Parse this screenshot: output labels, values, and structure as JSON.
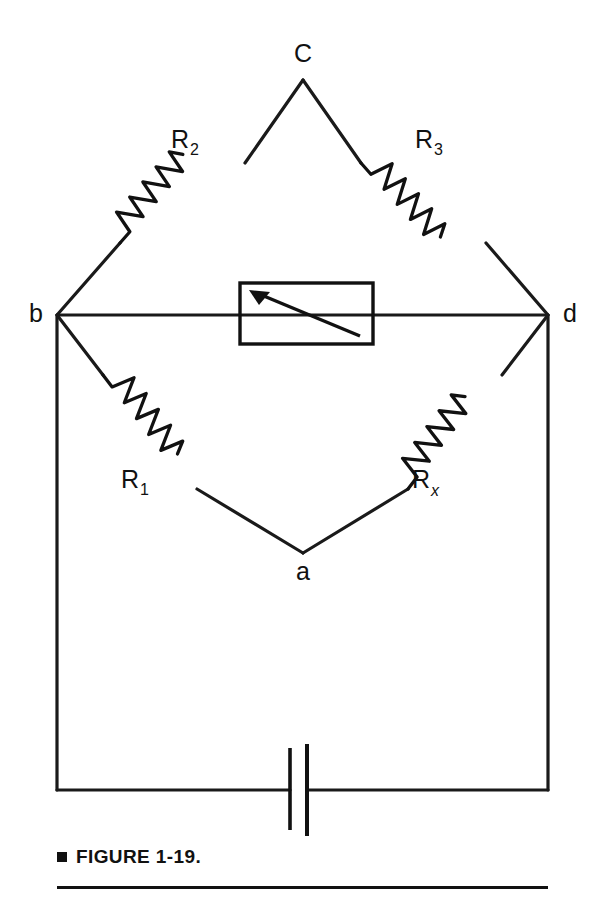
{
  "figure": {
    "caption_bullet": "■",
    "caption_text": "FIGURE 1-19."
  },
  "nodes": [
    {
      "id": "c",
      "label": "C",
      "x": 303,
      "y": 80,
      "label_x": 303,
      "label_y": 62
    },
    {
      "id": "b",
      "label": "b",
      "x": 57,
      "y": 315,
      "label_x": 36,
      "label_y": 322
    },
    {
      "id": "d",
      "label": "d",
      "x": 548,
      "y": 315,
      "label_x": 570,
      "label_y": 322
    },
    {
      "id": "a",
      "label": "a",
      "x": 303,
      "y": 553,
      "label_x": 303,
      "label_y": 580
    }
  ],
  "resistors": [
    {
      "id": "r2",
      "base": "R",
      "sub": "2",
      "sub_italic": false,
      "label_x": 180,
      "label_y": 148,
      "branch": "b-c"
    },
    {
      "id": "r3",
      "base": "R",
      "sub": "3",
      "sub_italic": false,
      "label_x": 424,
      "label_y": 148,
      "branch": "c-d"
    },
    {
      "id": "r1",
      "base": "R",
      "sub": "1",
      "sub_italic": false,
      "label_x": 130,
      "label_y": 488,
      "branch": "b-a"
    },
    {
      "id": "rx",
      "base": "R",
      "sub": "x",
      "sub_italic": true,
      "label_x": 421,
      "label_y": 488,
      "branch": "a-d"
    }
  ],
  "meter": {
    "name": "galvanometer",
    "box": {
      "x": 240,
      "y": 283,
      "width": 133,
      "height": 61
    },
    "needle_from": {
      "x": 360,
      "y": 336
    },
    "needle_to": {
      "x": 252,
      "y": 291
    }
  },
  "battery": {
    "name": "battery",
    "wire_y": 790,
    "negative_plate": {
      "x": 290,
      "y1": 748,
      "y2": 830
    },
    "positive_plate": {
      "x": 307,
      "y1": 744,
      "y2": 836
    }
  },
  "frame": {
    "left_x": 57,
    "right_x": 548,
    "top_y": 315,
    "bottom_y": 790
  },
  "colors": {
    "ink": "#111111",
    "background": "#ffffff"
  }
}
